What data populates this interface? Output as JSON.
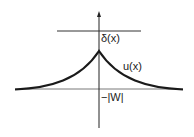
{
  "figure": {
    "labels": {
      "delta": "δ(x)",
      "u": "u(x)",
      "w": "−|W|"
    },
    "colors": {
      "axis": "#333333",
      "curve": "#1a1a1a",
      "background": "#ffffff"
    }
  }
}
